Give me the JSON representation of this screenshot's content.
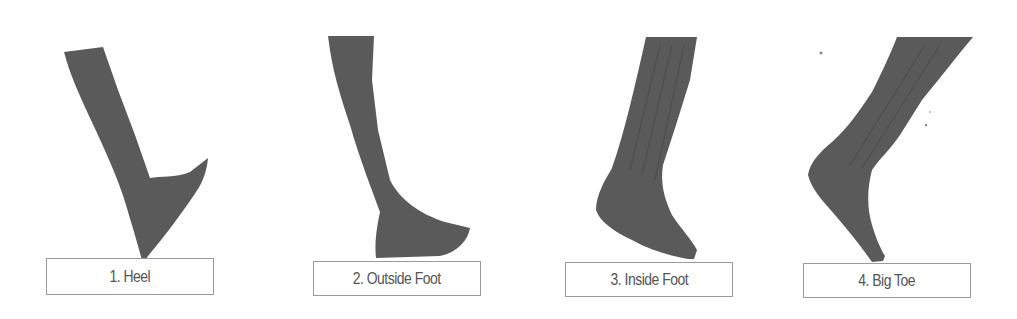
{
  "figure": {
    "panels": [
      {
        "number": 1,
        "label": "1. Heel",
        "contact_point": "heel"
      },
      {
        "number": 2,
        "label": "2. Outside Foot",
        "contact_point": "outside-foot"
      },
      {
        "number": 3,
        "label": "3. Inside Foot",
        "contact_point": "inside-foot"
      },
      {
        "number": 4,
        "label": "4. Big Toe",
        "contact_point": "big-toe"
      }
    ],
    "colors": {
      "leg_fill": "#5a5a5a",
      "label_border": "#9a9a9a",
      "label_text": "#555555",
      "background": "#ffffff"
    }
  }
}
